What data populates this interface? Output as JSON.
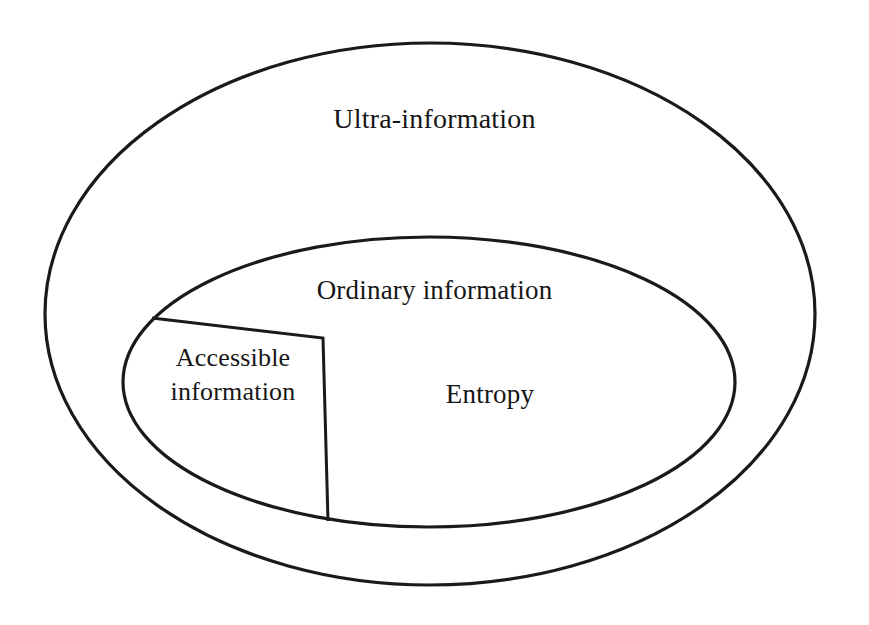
{
  "diagram": {
    "background_color": "#ffffff",
    "stroke_color": "#1a1a1a",
    "regions": {
      "outer": {
        "label": "Ultra-information",
        "shape": "ellipse",
        "cx": 430,
        "cy": 314,
        "rx": 385,
        "ry": 271,
        "stroke_width": 3.2
      },
      "inner": {
        "label": "Ordinary information",
        "shape": "ellipse",
        "cx": 429,
        "cy": 382,
        "rx": 306,
        "ry": 145,
        "stroke_width": 3.2
      },
      "entropy": {
        "label": "Entropy"
      },
      "accessible": {
        "label": "Accessible\ninformation",
        "shape": "wedge",
        "stroke_width": 3.0,
        "path": "M 152 318 L 323 338 L 328 521",
        "vertices": [
          {
            "x": 152,
            "y": 318
          },
          {
            "x": 323,
            "y": 338
          },
          {
            "x": 328,
            "y": 521
          }
        ]
      }
    }
  }
}
